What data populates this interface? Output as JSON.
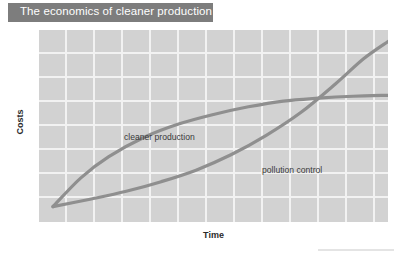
{
  "header": {
    "title": "The economics of cleaner production",
    "banner_color": "#7d7d7d",
    "title_color": "#ffffff"
  },
  "chart_data": {
    "type": "line",
    "title": "The economics of cleaner production",
    "xlabel": "Time",
    "ylabel": "Costs",
    "grid": true,
    "legend_position": "inline-annotations",
    "axis_ticks": {
      "x": [],
      "y": []
    },
    "xlim": [
      0,
      10
    ],
    "ylim": [
      0,
      10
    ],
    "plot_background": "#d2d2d2",
    "gridline_color": "#f2f2f2",
    "series_color": "#8f8f8f",
    "series": [
      {
        "name": "cleaner production",
        "shape": "logarithmic-rising-then-flattening",
        "x": [
          0.4,
          1.2,
          2.0,
          3.0,
          4.0,
          5.0,
          6.0,
          7.0,
          8.0,
          9.0,
          10.0
        ],
        "y": [
          0.8,
          2.3,
          3.4,
          4.4,
          5.1,
          5.6,
          6.0,
          6.3,
          6.45,
          6.55,
          6.6
        ],
        "label_position": {
          "x": 2.4,
          "y": 5.7
        }
      },
      {
        "name": "pollution control",
        "shape": "exponential-flat-then-steep",
        "x": [
          0.4,
          1.5,
          2.5,
          3.5,
          4.5,
          5.5,
          6.5,
          7.5,
          8.5,
          9.3,
          10.0
        ],
        "y": [
          0.8,
          1.2,
          1.6,
          2.1,
          2.7,
          3.5,
          4.5,
          5.7,
          7.2,
          8.5,
          9.4
        ],
        "label_position": {
          "x": 6.6,
          "y": 2.9
        }
      }
    ],
    "annotations": [
      {
        "text": "cleaner production"
      },
      {
        "text": "pollution control"
      }
    ],
    "crossing_point": {
      "x": 7.85,
      "y": 6.35
    }
  },
  "footer": {
    "rule_color": "#e4e4e4"
  }
}
